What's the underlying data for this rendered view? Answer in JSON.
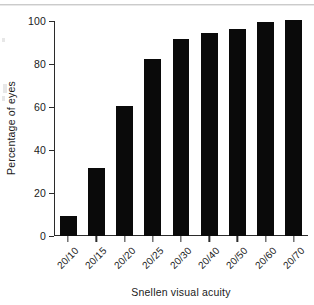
{
  "chart_data": {
    "type": "bar",
    "title": "",
    "subtitle": "",
    "xlabel": "Snellen visual acuity",
    "ylabel": "Percentage of eyes",
    "categories": [
      "20/10",
      "20/15",
      "20/20",
      "20/25",
      "20/30",
      "20/40",
      "20/50",
      "20/60",
      "20/70"
    ],
    "values": [
      9,
      31,
      60,
      82,
      91,
      94,
      96,
      99,
      100
    ],
    "ylim": [
      0,
      100
    ],
    "yticks": [
      0,
      20,
      40,
      60,
      80,
      100
    ],
    "ytick_labels": [
      "0",
      "20",
      "40",
      "60",
      "80",
      "100"
    ],
    "grid": false,
    "legend": null,
    "legend_position": "none",
    "bar_color": "#0a0a0a",
    "background_color": "#ffffff",
    "axis_color": "#2b2b2b",
    "xtick_label_rotation": -45,
    "annotations": []
  }
}
